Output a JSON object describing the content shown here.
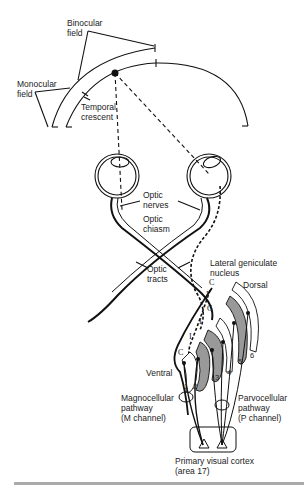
{
  "diagram": {
    "labels": {
      "binocular_field": "Binocular\nfield",
      "monocular_field": "Monocular\nfield",
      "temporal_crescent": "Temporal\ncrescent",
      "optic_nerves": "Optic\nnerves",
      "optic_chiasm": "Optic\nchiasm",
      "optic_tracts": "Optic\ntracts",
      "lateral_geniculate_nucleus": "Lateral geniculate\nnucleus",
      "dorsal": "Dorsal",
      "ventral": "Ventral",
      "magnocellular_pathway": "Magnocellular\npathway\n(M channel)",
      "parvocellular_pathway": "Parvocellular\npathway\n(P channel)",
      "primary_visual_cortex": "Primary visual cortex\n(area 17)"
    },
    "lgn_layers": [
      "1",
      "2",
      "3",
      "4",
      "5",
      "6"
    ],
    "layer_markers": {
      "contralateral": "C",
      "ipsilateral": "I"
    },
    "colors": {
      "line": "#111111",
      "layer_fill": "#999999",
      "rule": "#aaaaaa"
    }
  }
}
